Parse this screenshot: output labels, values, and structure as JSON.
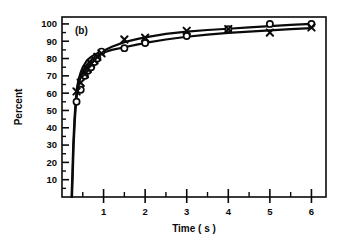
{
  "figure": {
    "panel_label": "(b)",
    "background_color": "#ffffff",
    "ink_color": "#0a0a0a"
  },
  "chart_data": {
    "type": "line",
    "title": "",
    "subtitle": "",
    "panel": "(b)",
    "xlabel": "Time ( s )",
    "ylabel": "Percent",
    "xlim": [
      0,
      6.35
    ],
    "ylim": [
      0,
      104
    ],
    "grid": false,
    "legend": "none",
    "x_major_ticks": [
      1,
      2,
      3,
      4,
      5,
      6
    ],
    "x_major_tick_labels": [
      "1",
      "2",
      "3",
      "4",
      "5",
      "6"
    ],
    "x_minor_ticks": [
      0.5,
      1.5,
      2.5,
      3.5,
      4.5,
      5.5
    ],
    "y_major_ticks": [
      10,
      20,
      30,
      40,
      50,
      60,
      70,
      80,
      90,
      100
    ],
    "y_major_tick_labels": [
      "10",
      "20",
      "30",
      "40",
      "50",
      "60",
      "70",
      "80",
      "90",
      "100"
    ],
    "y_minor_ticks": [
      15,
      25,
      35,
      45,
      55,
      65,
      75,
      85,
      95
    ],
    "series": [
      {
        "name": "open-circle-series",
        "marker": "open-circle",
        "x": [
          0.35,
          0.45,
          0.55,
          0.62,
          0.7,
          0.78,
          0.85,
          0.95,
          1.5,
          2.0,
          3.0,
          4.0,
          5.0,
          6.0
        ],
        "values": [
          55,
          62,
          70,
          73,
          75,
          78,
          80,
          84,
          86,
          89,
          93,
          97,
          100,
          100
        ]
      },
      {
        "name": "cross-series",
        "marker": "cross",
        "x": [
          0.35,
          0.45,
          0.55,
          0.62,
          0.7,
          0.78,
          0.85,
          0.95,
          1.5,
          2.0,
          3.0,
          4.0,
          5.0,
          6.0
        ],
        "values": [
          61,
          66,
          71,
          74,
          77,
          79,
          81,
          83,
          91,
          92,
          96,
          97,
          95,
          98
        ]
      }
    ],
    "curves": [
      {
        "name": "upper-fitted-curve",
        "points": [
          [
            0.23,
            0
          ],
          [
            0.25,
            14
          ],
          [
            0.27,
            30
          ],
          [
            0.3,
            45
          ],
          [
            0.33,
            56
          ],
          [
            0.36,
            63
          ],
          [
            0.4,
            68
          ],
          [
            0.45,
            72
          ],
          [
            0.5,
            75
          ],
          [
            0.55,
            77
          ],
          [
            0.6,
            79
          ],
          [
            0.7,
            81
          ],
          [
            0.8,
            82.5
          ],
          [
            0.9,
            83.5
          ],
          [
            1.0,
            84.5
          ],
          [
            1.2,
            86.8
          ],
          [
            1.5,
            89.5
          ],
          [
            1.8,
            91.2
          ],
          [
            2.0,
            92.2
          ],
          [
            2.5,
            94.2
          ],
          [
            3.0,
            95.6
          ],
          [
            3.5,
            96.5
          ],
          [
            4.0,
            97.2
          ],
          [
            4.5,
            98.0
          ],
          [
            5.0,
            98.7
          ],
          [
            5.5,
            99.4
          ],
          [
            6.0,
            100
          ]
        ]
      },
      {
        "name": "lower-fitted-curve",
        "points": [
          [
            0.24,
            0
          ],
          [
            0.26,
            14
          ],
          [
            0.28,
            30
          ],
          [
            0.31,
            45
          ],
          [
            0.34,
            55
          ],
          [
            0.37,
            61
          ],
          [
            0.41,
            66
          ],
          [
            0.46,
            70
          ],
          [
            0.51,
            73
          ],
          [
            0.56,
            75
          ],
          [
            0.62,
            77
          ],
          [
            0.72,
            79.5
          ],
          [
            0.82,
            81
          ],
          [
            0.92,
            82.5
          ],
          [
            1.0,
            83.5
          ],
          [
            1.2,
            85
          ],
          [
            1.5,
            86.5
          ],
          [
            1.8,
            88
          ],
          [
            2.0,
            89
          ],
          [
            2.5,
            91
          ],
          [
            3.0,
            92.6
          ],
          [
            3.5,
            93.8
          ],
          [
            4.0,
            94.8
          ],
          [
            4.5,
            95.6
          ],
          [
            5.0,
            96.3
          ],
          [
            5.5,
            97.0
          ],
          [
            6.0,
            97.6
          ]
        ]
      }
    ]
  }
}
